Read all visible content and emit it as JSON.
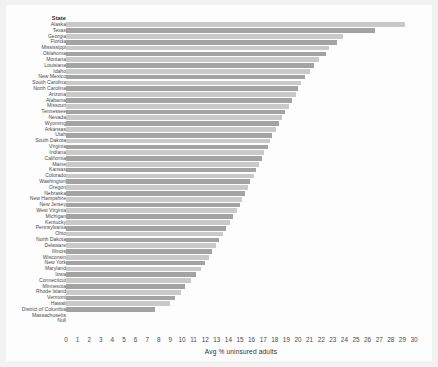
{
  "chart_data": {
    "type": "bar",
    "orientation": "horizontal",
    "title": "",
    "xlabel": "Avg % uninsured adults",
    "ylabel": "State",
    "xlim": [
      0,
      30
    ],
    "xticks": [
      "0",
      "1",
      "2",
      "3",
      "4",
      "5",
      "6",
      "7",
      "8",
      "9",
      "10",
      "11",
      "12",
      "13",
      "14",
      "15",
      "16",
      "17",
      "18",
      "19",
      "20",
      "21",
      "22",
      "23",
      "24",
      "25",
      "26",
      "27",
      "28",
      "29",
      "30"
    ],
    "grid": false,
    "legend": false,
    "bar_colors": {
      "light": "#c9c9c9",
      "dark": "#a3a3a3"
    },
    "categories": [
      "Alaska",
      "Texas",
      "Georgia",
      "Florida",
      "Mississippi",
      "Oklahoma",
      "Montana",
      "Louisiana",
      "Idaho",
      "New Mexico",
      "South Carolina",
      "North Carolina",
      "Arizona",
      "Alabama",
      "Missouri",
      "Tennessee",
      "Nevada",
      "Wyoming",
      "Arkansas",
      "Utah",
      "South Dakota",
      "Virginia",
      "Indiana",
      "California",
      "Maine",
      "Kansas",
      "Colorado",
      "Washington",
      "Oregon",
      "Nebraska",
      "New Hampshire",
      "New Jersey",
      "West Virginia",
      "Michigan",
      "Kentucky",
      "Pennsylvania",
      "Ohio",
      "North Dakota",
      "Delaware",
      "Illinois",
      "Wisconsin",
      "New York",
      "Maryland",
      "Iowa",
      "Connecticut",
      "Minnesota",
      "Rhode Island",
      "Vermont",
      "Hawaii",
      "District of Columbia",
      "Massachusetts",
      "Null"
    ],
    "values": [
      29.2,
      26.6,
      23.9,
      23.4,
      22.7,
      22.4,
      21.8,
      21.4,
      21.0,
      20.6,
      20.3,
      20.0,
      19.8,
      19.5,
      19.2,
      18.9,
      18.6,
      18.4,
      18.1,
      17.8,
      17.6,
      17.4,
      17.1,
      16.9,
      16.6,
      16.4,
      16.2,
      15.9,
      15.7,
      15.4,
      15.2,
      15.0,
      14.7,
      14.4,
      14.1,
      13.8,
      13.5,
      13.2,
      12.9,
      12.6,
      12.3,
      12.0,
      11.6,
      11.2,
      10.8,
      10.3,
      9.9,
      9.4,
      9.0,
      7.7,
      0,
      0
    ],
    "header_label": "State"
  }
}
